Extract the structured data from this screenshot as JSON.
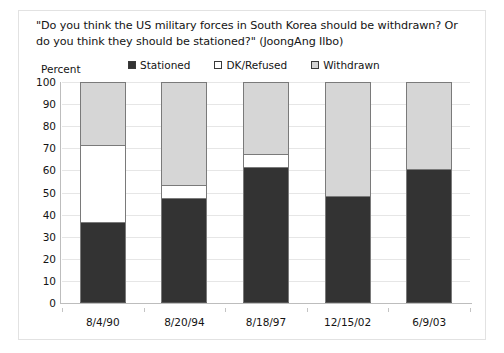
{
  "figure": {
    "title": "\"Do you think the US military forces in South Korea should be withdrawn? Or do you think they should be stationed?\" (JoongAng Ilbo)",
    "y_axis_title": "Percent"
  },
  "legend": {
    "items": [
      {
        "label": "Stationed",
        "swatch": "dark-filled-square",
        "color": "#333333"
      },
      {
        "label": "DK/Refused",
        "swatch": "white-empty-square",
        "color": "#ffffff"
      },
      {
        "label": "Withdrawn",
        "swatch": "light-gray-square",
        "color": "#d6d6d6"
      }
    ]
  },
  "chart_data": {
    "type": "bar",
    "stacked": true,
    "title": "\"Do you think the US military forces in South Korea should be withdrawn? Or do you think they should be stationed?\" (JoongAng Ilbo)",
    "xlabel": "",
    "ylabel": "Percent",
    "ylim": [
      0,
      100
    ],
    "yticks": [
      0,
      10,
      20,
      30,
      40,
      50,
      60,
      70,
      80,
      90,
      100
    ],
    "ytick_labels": [
      "0",
      "10",
      "20",
      "30",
      "40",
      "50",
      "60",
      "70",
      "80",
      "90",
      "100"
    ],
    "grid": true,
    "legend_position": "top-center",
    "categories": [
      "8/4/90",
      "8/20/94",
      "8/18/97",
      "12/15/02",
      "6/9/03"
    ],
    "series": [
      {
        "name": "Stationed",
        "color": "#333333",
        "values": [
          36,
          47,
          61,
          48,
          60
        ]
      },
      {
        "name": "DK/Refused",
        "color": "#ffffff",
        "values": [
          35,
          6,
          6,
          0,
          0
        ]
      },
      {
        "name": "Withdrawn",
        "color": "#d6d6d6",
        "values": [
          29,
          47,
          33,
          52,
          40
        ]
      }
    ]
  }
}
